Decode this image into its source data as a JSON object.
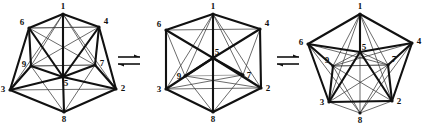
{
  "figure": {
    "name": "cluster-rearrangement-equilibrium",
    "background_color": "#ffffff",
    "line_colors": {
      "bold": "#111111",
      "thin": "#3a3a3a",
      "light": "#9a9a9a"
    },
    "operator_symbol": "equilibrium-double-arrow",
    "operators": [
      {
        "label": "⇌",
        "name": "equilibrium-arrow-1"
      },
      {
        "label": "⇌",
        "name": "equilibrium-arrow-2"
      }
    ],
    "structures": [
      {
        "name": "structure-left",
        "caption": "",
        "vertex_labels": [
          "1",
          "2",
          "3",
          "4",
          "5",
          "6",
          "7",
          "8",
          "9"
        ],
        "vertices": [
          {
            "id": "1",
            "label": "1",
            "x": 63,
            "y": 14
          },
          {
            "id": "6",
            "label": "6",
            "x": 29,
            "y": 28
          },
          {
            "id": "4",
            "label": "4",
            "x": 99,
            "y": 27
          },
          {
            "id": "9",
            "label": "9",
            "x": 31,
            "y": 66
          },
          {
            "id": "7",
            "label": "7",
            "x": 95,
            "y": 65
          },
          {
            "id": "5",
            "label": "5",
            "x": 63,
            "y": 77
          },
          {
            "id": "3",
            "label": "3",
            "x": 10,
            "y": 90
          },
          {
            "id": "2",
            "label": "2",
            "x": 116,
            "y": 89
          },
          {
            "id": "8",
            "label": "8",
            "x": 64,
            "y": 112
          }
        ],
        "label_offsets": [
          {
            "id": "1",
            "dx": 0,
            "dy": -5
          },
          {
            "id": "6",
            "dx": -7,
            "dy": -3
          },
          {
            "id": "4",
            "dx": 7,
            "dy": -3
          },
          {
            "id": "9",
            "dx": -7,
            "dy": 1
          },
          {
            "id": "7",
            "dx": 7,
            "dy": 1
          },
          {
            "id": "5",
            "dx": 3,
            "dy": 9
          },
          {
            "id": "3",
            "dx": -7,
            "dy": 2
          },
          {
            "id": "2",
            "dx": 7,
            "dy": 2
          },
          {
            "id": "8",
            "dx": 0,
            "dy": 10
          }
        ],
        "edges_bold": [
          [
            "1",
            "5"
          ],
          [
            "3",
            "5"
          ],
          [
            "5",
            "2"
          ],
          [
            "5",
            "8"
          ],
          [
            "6",
            "5"
          ],
          [
            "4",
            "5"
          ],
          [
            "6",
            "3"
          ],
          [
            "4",
            "2"
          ],
          [
            "3",
            "8"
          ],
          [
            "8",
            "2"
          ],
          [
            "6",
            "9"
          ],
          [
            "4",
            "7"
          ],
          [
            "9",
            "3"
          ],
          [
            "7",
            "2"
          ],
          [
            "9",
            "5"
          ],
          [
            "7",
            "5"
          ],
          [
            "1",
            "6"
          ],
          [
            "1",
            "4"
          ]
        ],
        "edges_thin": [
          [
            "1",
            "9"
          ],
          [
            "1",
            "7"
          ],
          [
            "6",
            "4"
          ],
          [
            "9",
            "7"
          ],
          [
            "3",
            "2"
          ],
          [
            "1",
            "2"
          ],
          [
            "1",
            "3"
          ],
          [
            "9",
            "8"
          ],
          [
            "7",
            "8"
          ],
          [
            "6",
            "7"
          ],
          [
            "4",
            "9"
          ]
        ],
        "edges_light": [
          [
            "6",
            "4"
          ],
          [
            "9",
            "7"
          ],
          [
            "6",
            "9"
          ],
          [
            "4",
            "7"
          ]
        ]
      },
      {
        "name": "structure-middle",
        "caption": "",
        "vertices": [
          {
            "id": "1",
            "label": "1",
            "x": 213,
            "y": 14
          },
          {
            "id": "6",
            "label": "6",
            "x": 166,
            "y": 30
          },
          {
            "id": "4",
            "label": "4",
            "x": 260,
            "y": 29
          },
          {
            "id": "5",
            "label": "5",
            "x": 213,
            "y": 58
          },
          {
            "id": "9",
            "label": "9",
            "x": 185,
            "y": 76
          },
          {
            "id": "7",
            "label": "7",
            "x": 243,
            "y": 75
          },
          {
            "id": "3",
            "label": "3",
            "x": 166,
            "y": 89
          },
          {
            "id": "2",
            "label": "2",
            "x": 261,
            "y": 88
          },
          {
            "id": "8",
            "label": "8",
            "x": 213,
            "y": 112
          }
        ],
        "label_offsets": [
          {
            "id": "1",
            "dx": 0,
            "dy": -5
          },
          {
            "id": "6",
            "dx": -7,
            "dy": -3
          },
          {
            "id": "4",
            "dx": 7,
            "dy": -3
          },
          {
            "id": "5",
            "dx": 4,
            "dy": -3
          },
          {
            "id": "9",
            "dx": -6,
            "dy": 3
          },
          {
            "id": "7",
            "dx": 6,
            "dy": 3
          },
          {
            "id": "3",
            "dx": -7,
            "dy": 3
          },
          {
            "id": "2",
            "dx": 7,
            "dy": 3
          },
          {
            "id": "8",
            "dx": 0,
            "dy": 10
          }
        ],
        "edges_bold": [
          [
            "1",
            "5"
          ],
          [
            "5",
            "8"
          ],
          [
            "6",
            "5"
          ],
          [
            "4",
            "5"
          ],
          [
            "9",
            "5"
          ],
          [
            "7",
            "5"
          ],
          [
            "1",
            "6"
          ],
          [
            "1",
            "4"
          ],
          [
            "6",
            "3"
          ],
          [
            "4",
            "2"
          ],
          [
            "3",
            "8"
          ],
          [
            "8",
            "2"
          ],
          [
            "3",
            "5"
          ],
          [
            "2",
            "5"
          ]
        ],
        "edges_thin": [
          [
            "1",
            "9"
          ],
          [
            "1",
            "7"
          ],
          [
            "1",
            "3"
          ],
          [
            "1",
            "2"
          ],
          [
            "9",
            "8"
          ],
          [
            "7",
            "8"
          ],
          [
            "9",
            "3"
          ],
          [
            "7",
            "2"
          ],
          [
            "6",
            "9"
          ],
          [
            "4",
            "7"
          ],
          [
            "3",
            "2"
          ],
          [
            "6",
            "4"
          ],
          [
            "9",
            "2"
          ],
          [
            "7",
            "3"
          ]
        ],
        "edges_light": [
          [
            "9",
            "7"
          ]
        ]
      },
      {
        "name": "structure-right",
        "caption": "",
        "vertices": [
          {
            "id": "1",
            "label": "1",
            "x": 360,
            "y": 14
          },
          {
            "id": "6",
            "label": "6",
            "x": 308,
            "y": 44
          },
          {
            "id": "4",
            "label": "4",
            "x": 412,
            "y": 43
          },
          {
            "id": "5",
            "label": "5",
            "x": 360,
            "y": 52
          },
          {
            "id": "9",
            "label": "9",
            "x": 333,
            "y": 66
          },
          {
            "id": "7",
            "label": "7",
            "x": 388,
            "y": 65
          },
          {
            "id": "3",
            "label": "3",
            "x": 329,
            "y": 102
          },
          {
            "id": "2",
            "label": "2",
            "x": 392,
            "y": 101
          },
          {
            "id": "8",
            "label": "8",
            "x": 360,
            "y": 113
          }
        ],
        "label_offsets": [
          {
            "id": "1",
            "dx": 0,
            "dy": -5
          },
          {
            "id": "6",
            "dx": -7,
            "dy": 1
          },
          {
            "id": "4",
            "dx": 7,
            "dy": 1
          },
          {
            "id": "5",
            "dx": 4,
            "dy": -2
          },
          {
            "id": "9",
            "dx": -6,
            "dy": -3
          },
          {
            "id": "7",
            "dx": 6,
            "dy": -3
          },
          {
            "id": "3",
            "dx": -7,
            "dy": 3
          },
          {
            "id": "2",
            "dx": 7,
            "dy": 3
          },
          {
            "id": "8",
            "dx": 0,
            "dy": 10
          }
        ],
        "edges_bold": [
          [
            "1",
            "5"
          ],
          [
            "6",
            "5"
          ],
          [
            "4",
            "5"
          ],
          [
            "3",
            "5"
          ],
          [
            "2",
            "5"
          ],
          [
            "1",
            "6"
          ],
          [
            "1",
            "4"
          ],
          [
            "6",
            "3"
          ],
          [
            "4",
            "2"
          ],
          [
            "3",
            "2"
          ],
          [
            "9",
            "3"
          ],
          [
            "7",
            "2"
          ],
          [
            "6",
            "9"
          ],
          [
            "4",
            "7"
          ]
        ],
        "edges_thin": [
          [
            "1",
            "9"
          ],
          [
            "1",
            "7"
          ],
          [
            "9",
            "5"
          ],
          [
            "7",
            "5"
          ],
          [
            "3",
            "8"
          ],
          [
            "8",
            "2"
          ],
          [
            "9",
            "8"
          ],
          [
            "7",
            "8"
          ],
          [
            "5",
            "8"
          ],
          [
            "6",
            "8"
          ],
          [
            "4",
            "8"
          ],
          [
            "9",
            "2"
          ],
          [
            "7",
            "3"
          ],
          [
            "9",
            "7"
          ],
          [
            "6",
            "7"
          ],
          [
            "4",
            "9"
          ],
          [
            "1",
            "3"
          ],
          [
            "1",
            "2"
          ]
        ],
        "edges_light": [
          [
            "9",
            "7"
          ],
          [
            "9",
            "3"
          ],
          [
            "7",
            "2"
          ],
          [
            "3",
            "2"
          ]
        ]
      }
    ]
  }
}
